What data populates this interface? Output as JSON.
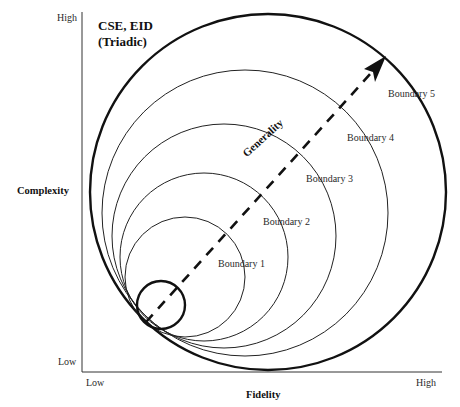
{
  "diagram": {
    "title_line1": "CSE, EID",
    "title_line2": "(Triadic)",
    "y_axis": {
      "title": "Complexity",
      "high": "High",
      "low": "Low"
    },
    "x_axis": {
      "title": "Fidelity",
      "low": "Low",
      "high": "High"
    },
    "arrow_label": "Generality",
    "boundaries": [
      {
        "label": "Boundary 1"
      },
      {
        "label": "Boundary 2"
      },
      {
        "label": "Boundary 3"
      },
      {
        "label": "Boundary 4"
      },
      {
        "label": "Boundary 5"
      }
    ],
    "colors": {
      "line": "#1a1a1a",
      "background": "#ffffff"
    }
  }
}
